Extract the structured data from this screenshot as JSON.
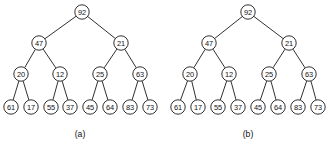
{
  "figure": {
    "title": "",
    "background_color": "#ffffff",
    "node_fill": "#ffffff",
    "node_stroke": "#1a1a1a",
    "edge_color": "#1a1a1a",
    "text_color": "#111111"
  },
  "chart_data": {
    "type": "diagram",
    "subtype": "binary-tree",
    "title": "",
    "panels": [
      {
        "caption": "(a)",
        "caption_x": 80,
        "caption_y": 134,
        "nodes": [
          {
            "id": "a-92",
            "label": "92",
            "x": 82,
            "y": 12,
            "r": 7.2
          },
          {
            "id": "a-47",
            "label": "47",
            "x": 39,
            "y": 43,
            "r": 7.2
          },
          {
            "id": "a-21",
            "label": "21",
            "x": 121,
            "y": 43,
            "r": 7.2
          },
          {
            "id": "a-20",
            "label": "20",
            "x": 21,
            "y": 74,
            "r": 7.2
          },
          {
            "id": "a-12",
            "label": "12",
            "x": 60,
            "y": 74,
            "r": 7.2
          },
          {
            "id": "a-25",
            "label": "25",
            "x": 100,
            "y": 74,
            "r": 7.2
          },
          {
            "id": "a-63",
            "label": "63",
            "x": 140,
            "y": 74,
            "r": 7.2
          },
          {
            "id": "a-61",
            "label": "61",
            "x": 11,
            "y": 107,
            "r": 7.2
          },
          {
            "id": "a-17",
            "label": "17",
            "x": 31,
            "y": 107,
            "r": 7.2
          },
          {
            "id": "a-55",
            "label": "55",
            "x": 51,
            "y": 107,
            "r": 7.2
          },
          {
            "id": "a-37",
            "label": "37",
            "x": 70,
            "y": 107,
            "r": 7.2
          },
          {
            "id": "a-45",
            "label": "45",
            "x": 90,
            "y": 107,
            "r": 7.2
          },
          {
            "id": "a-64",
            "label": "64",
            "x": 110,
            "y": 107,
            "r": 7.2
          },
          {
            "id": "a-83",
            "label": "83",
            "x": 130,
            "y": 107,
            "r": 7.2
          },
          {
            "id": "a-73",
            "label": "73",
            "x": 150,
            "y": 107,
            "r": 7.2
          }
        ],
        "edges": [
          {
            "from": "a-92",
            "to": "a-47"
          },
          {
            "from": "a-92",
            "to": "a-21"
          },
          {
            "from": "a-47",
            "to": "a-20"
          },
          {
            "from": "a-47",
            "to": "a-12"
          },
          {
            "from": "a-21",
            "to": "a-25"
          },
          {
            "from": "a-21",
            "to": "a-63"
          },
          {
            "from": "a-20",
            "to": "a-61"
          },
          {
            "from": "a-20",
            "to": "a-17"
          },
          {
            "from": "a-12",
            "to": "a-55"
          },
          {
            "from": "a-12",
            "to": "a-37"
          },
          {
            "from": "a-25",
            "to": "a-45"
          },
          {
            "from": "a-25",
            "to": "a-64"
          },
          {
            "from": "a-63",
            "to": "a-83"
          },
          {
            "from": "a-63",
            "to": "a-73"
          }
        ]
      },
      {
        "caption": "(b)",
        "caption_x": 248,
        "caption_y": 134,
        "nodes": [
          {
            "id": "b-92",
            "label": "92",
            "x": 248,
            "y": 12,
            "r": 7.2
          },
          {
            "id": "b-47",
            "label": "47",
            "x": 209,
            "y": 43,
            "r": 7.2
          },
          {
            "id": "b-21",
            "label": "21",
            "x": 289,
            "y": 43,
            "r": 7.2
          },
          {
            "id": "b-20",
            "label": "20",
            "x": 190,
            "y": 74,
            "r": 7.2
          },
          {
            "id": "b-12",
            "label": "12",
            "x": 229,
            "y": 74,
            "r": 7.2
          },
          {
            "id": "b-25",
            "label": "25",
            "x": 269,
            "y": 74,
            "r": 7.2
          },
          {
            "id": "b-63",
            "label": "63",
            "x": 309,
            "y": 74,
            "r": 7.2
          },
          {
            "id": "b-61",
            "label": "61",
            "x": 178,
            "y": 107,
            "r": 7.2
          },
          {
            "id": "b-17",
            "label": "17",
            "x": 198,
            "y": 107,
            "r": 7.2
          },
          {
            "id": "b-55",
            "label": "55",
            "x": 218,
            "y": 107,
            "r": 7.2
          },
          {
            "id": "b-37",
            "label": "37",
            "x": 238,
            "y": 107,
            "r": 7.2
          },
          {
            "id": "b-45",
            "label": "45",
            "x": 258,
            "y": 107,
            "r": 7.2
          },
          {
            "id": "b-64",
            "label": "64",
            "x": 278,
            "y": 107,
            "r": 7.2
          },
          {
            "id": "b-83",
            "label": "83",
            "x": 298,
            "y": 107,
            "r": 7.2
          },
          {
            "id": "b-73",
            "label": "73",
            "x": 318,
            "y": 107,
            "r": 7.2
          }
        ],
        "edges": [
          {
            "from": "b-92",
            "to": "b-47"
          },
          {
            "from": "b-92",
            "to": "b-21"
          },
          {
            "from": "b-47",
            "to": "b-20"
          },
          {
            "from": "b-47",
            "to": "b-12"
          },
          {
            "from": "b-21",
            "to": "b-25"
          },
          {
            "from": "b-21",
            "to": "b-63"
          },
          {
            "from": "b-20",
            "to": "b-61"
          },
          {
            "from": "b-20",
            "to": "b-17"
          },
          {
            "from": "b-12",
            "to": "b-55"
          },
          {
            "from": "b-12",
            "to": "b-37"
          },
          {
            "from": "b-25",
            "to": "b-45"
          },
          {
            "from": "b-25",
            "to": "b-64"
          },
          {
            "from": "b-63",
            "to": "b-83"
          },
          {
            "from": "b-63",
            "to": "b-73"
          }
        ]
      }
    ]
  }
}
